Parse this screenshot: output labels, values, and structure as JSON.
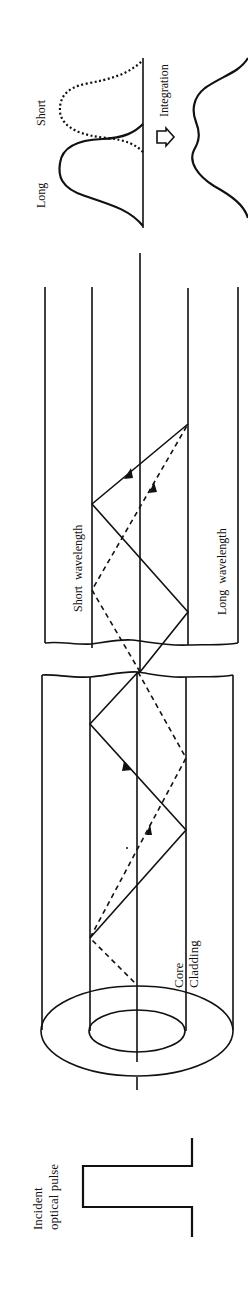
{
  "figure": {
    "colors": {
      "ink": "#111111",
      "background": "#ffffff"
    }
  },
  "labels": {
    "incident_line1": "Incident",
    "incident_line2": "optical pulse",
    "core": "Core",
    "cladding": "Cladding",
    "short_wavelength": "Short  wavelength",
    "long_wavelength": "Long  wavelength",
    "output_long": "Long",
    "output_short": "Short",
    "integration": "Integration"
  },
  "legend": {
    "solid_ray": "Long wavelength path",
    "dashed_ray": "Short wavelength path"
  },
  "icons": {
    "integration_arrow": "hollow-arrow-right"
  }
}
